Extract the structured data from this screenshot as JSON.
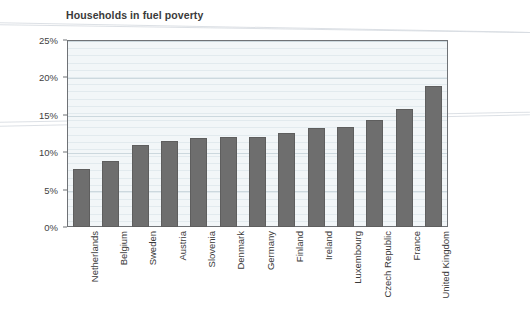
{
  "chart_data": {
    "type": "bar",
    "title": "Households in fuel poverty",
    "xlabel": "",
    "ylabel": "",
    "ylim": [
      0,
      25
    ],
    "grid": true,
    "legend": false,
    "tick_suffix": "%",
    "categories": [
      "Netherlands",
      "Belgium",
      "Sweden",
      "Austria",
      "Slovenia",
      "Denmark",
      "Germany",
      "Finland",
      "Ireland",
      "Luxembourg",
      "Czech Republic",
      "France",
      "United Kingdom"
    ],
    "values": [
      7.8,
      8.8,
      11.0,
      11.5,
      11.9,
      12.0,
      12.1,
      12.6,
      13.2,
      13.4,
      14.3,
      15.8,
      18.9
    ],
    "yticks": [
      0,
      5,
      10,
      15,
      20,
      25
    ],
    "ytick_labels": [
      "0%",
      "5%",
      "10%",
      "15%",
      "20%",
      "25%"
    ],
    "bar_color": "#6e6e6e",
    "plot_background": "#f2f6f8",
    "frame_color": "#6f7276",
    "title_color": "#3a3a3a"
  }
}
